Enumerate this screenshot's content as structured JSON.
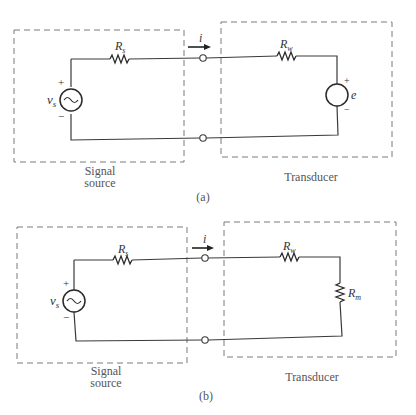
{
  "figures": [
    {
      "id": "a",
      "caption": "(a)",
      "source_box_label_line1": "Signal",
      "source_box_label_line2": "source",
      "transducer_box_label": "Transducer",
      "source_voltage": {
        "symbol": "v",
        "subscript": "s",
        "plus": "+",
        "minus": "−"
      },
      "source_resistor": {
        "symbol": "R",
        "subscript": "s"
      },
      "current_label": "i",
      "wire_resistor": {
        "symbol": "R",
        "subscript": "w"
      },
      "transducer_emf": {
        "symbol": "e",
        "plus": "+",
        "minus": "−"
      }
    },
    {
      "id": "b",
      "caption": "(b)",
      "source_box_label_line1": "Signal",
      "source_box_label_line2": "source",
      "transducer_box_label": "Transducer",
      "source_voltage": {
        "symbol": "v",
        "subscript": "s",
        "plus": "+",
        "minus": "−"
      },
      "source_resistor": {
        "symbol": "R",
        "subscript": "s"
      },
      "current_label": "i",
      "wire_resistor": {
        "symbol": "R",
        "subscript": "w"
      },
      "load_resistor": {
        "symbol": "R",
        "subscript": "m"
      }
    }
  ]
}
